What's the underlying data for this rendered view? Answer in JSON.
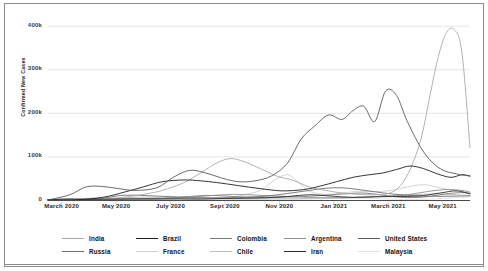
{
  "chart_data": {
    "type": "line",
    "title": "",
    "xlabel": "",
    "ylabel": "Confirmed New Cases",
    "ylim": [
      0,
      420000
    ],
    "yticks": [
      0,
      100000,
      200000,
      300000,
      400000
    ],
    "ytick_labels": [
      "0",
      "100k",
      "200k",
      "300k",
      "400k"
    ],
    "xtick_labels": [
      "March 2020",
      "May 2020",
      "July 2020",
      "Sept 2020",
      "Nov 2020",
      "Jan 2021",
      "March 2021",
      "May 2021"
    ],
    "xtick_positions": [
      0.5,
      2.5,
      4.5,
      6.5,
      8.5,
      10.5,
      12.5,
      14.5
    ],
    "x_unit": "month index from Feb 2020",
    "xlim": [
      0,
      15.5
    ],
    "grid": "horizontal",
    "legend_position": "bottom",
    "series": [
      {
        "name": "India",
        "color": "#a9a9a9",
        "x": [
          0,
          1,
          2,
          3,
          3.6,
          4.2,
          5,
          5.6,
          6.2,
          6.7,
          7.2,
          7.8,
          8.4,
          9,
          9.6,
          10.2,
          10.8,
          11.4,
          12,
          12.5,
          12.9,
          13.3,
          13.7,
          14.0,
          14.3,
          14.6,
          14.9,
          15.2,
          15.5
        ],
        "values": [
          0,
          100,
          2000,
          8000,
          14000,
          22000,
          40000,
          62000,
          85000,
          95000,
          88000,
          72000,
          55000,
          45000,
          30000,
          22000,
          16000,
          13000,
          12000,
          15000,
          30000,
          70000,
          140000,
          230000,
          320000,
          380000,
          392000,
          340000,
          120000
        ]
      },
      {
        "name": "Russia",
        "color": "#6d6d6d",
        "x": [
          0,
          1,
          2,
          2.6,
          3.2,
          4,
          5,
          6,
          7,
          8,
          8.8,
          9.6,
          10.2,
          10.8,
          11.4,
          12,
          12.6,
          13.2,
          13.8,
          14.4,
          15,
          15.5
        ],
        "values": [
          0,
          200,
          4000,
          10000,
          11000,
          9000,
          6500,
          5000,
          5500,
          9000,
          15000,
          22000,
          27000,
          28000,
          24000,
          19000,
          14000,
          11000,
          9000,
          8500,
          9000,
          9500
        ]
      },
      {
        "name": "Brazil",
        "color": "#1e1e1e",
        "x": [
          0,
          1,
          2,
          2.8,
          3.5,
          4.2,
          5,
          5.6,
          6.2,
          7,
          7.8,
          8.6,
          9.4,
          10,
          10.6,
          11.2,
          11.8,
          12.3,
          12.8,
          13.3,
          13.8,
          14.3,
          14.8,
          15.2,
          15.5
        ],
        "values": [
          0,
          300,
          6000,
          18000,
          30000,
          42000,
          46000,
          44000,
          40000,
          33000,
          26000,
          21000,
          24000,
          32000,
          42000,
          52000,
          58000,
          62000,
          70000,
          78000,
          72000,
          60000,
          52000,
          58000,
          55000
        ]
      },
      {
        "name": "France",
        "color": "#cfcfcf",
        "x": [
          0,
          1,
          1.8,
          2.5,
          3.5,
          4.5,
          5.5,
          6.5,
          7.2,
          7.8,
          8.3,
          8.8,
          9.2,
          9.6,
          10.2,
          10.8,
          11.4,
          12,
          12.6,
          13.2,
          13.8,
          14.4,
          15,
          15.5
        ],
        "values": [
          0,
          2000,
          5000,
          4000,
          1500,
          800,
          1500,
          5000,
          12000,
          22000,
          45000,
          58000,
          40000,
          20000,
          13000,
          16000,
          20000,
          19000,
          22000,
          30000,
          35000,
          28000,
          20000,
          16000
        ]
      },
      {
        "name": "Colombia",
        "color": "#7a7a7a",
        "x": [
          0,
          1.5,
          2.5,
          3.5,
          4.5,
          5.2,
          5.8,
          6.4,
          7,
          7.8,
          8.6,
          9.4,
          10.2,
          11,
          11.6,
          12.2,
          12.8,
          13.4,
          14,
          14.6,
          15.2,
          15.5
        ],
        "values": [
          0,
          200,
          1000,
          2500,
          5000,
          8000,
          10500,
          9500,
          7500,
          6000,
          6500,
          8000,
          11000,
          14500,
          16000,
          12000,
          7000,
          5500,
          8000,
          14000,
          17000,
          15000
        ]
      },
      {
        "name": "Chile",
        "color": "#bdbdbd",
        "x": [
          0,
          1.2,
          2.2,
          3,
          3.6,
          4.2,
          5,
          6,
          7,
          8,
          9,
          10,
          11,
          11.8,
          12.6,
          13.4,
          14.2,
          15,
          15.5
        ],
        "values": [
          0,
          300,
          2000,
          5500,
          6500,
          5000,
          3500,
          2500,
          2200,
          2500,
          3000,
          4000,
          5000,
          6500,
          9000,
          12000,
          14000,
          12000,
          10000
        ]
      },
      {
        "name": "Argentina",
        "color": "#8f8f8f",
        "x": [
          0,
          1.5,
          2.5,
          3.5,
          4.5,
          5.5,
          6.2,
          6.8,
          7.4,
          8,
          8.8,
          9.6,
          10.4,
          11.2,
          12,
          12.8,
          13.4,
          14,
          14.6,
          15.2,
          15.5
        ],
        "values": [
          0,
          100,
          600,
          1800,
          4000,
          8000,
          11000,
          13000,
          12000,
          10000,
          8000,
          6000,
          5000,
          6000,
          7500,
          10000,
          14000,
          20000,
          24000,
          22000,
          18000
        ]
      },
      {
        "name": "Iran",
        "color": "#2b2b2b",
        "x": [
          0,
          0.8,
          1.6,
          2.4,
          3.2,
          4,
          4.8,
          5.6,
          6.4,
          7.2,
          8,
          8.8,
          9.6,
          10.4,
          11.2,
          12,
          12.8,
          13.6,
          14.4,
          15,
          15.5
        ],
        "values": [
          800,
          2500,
          1500,
          2200,
          2800,
          2400,
          2700,
          2200,
          3500,
          4000,
          5000,
          8000,
          12000,
          9000,
          6000,
          7500,
          8000,
          9000,
          16000,
          21000,
          14000
        ]
      },
      {
        "name": "United States",
        "color": "#5a5a5a",
        "x": [
          0,
          0.8,
          1.4,
          2,
          2.6,
          3.2,
          4,
          4.6,
          5.2,
          5.8,
          6.4,
          7,
          7.6,
          8.2,
          8.8,
          9.3,
          9.8,
          10.3,
          10.8,
          11.2,
          11.6,
          12,
          12.4,
          12.8,
          13.2,
          13.8,
          14.4,
          15,
          15.5
        ],
        "values": [
          0,
          12000,
          30000,
          31000,
          26000,
          22000,
          28000,
          52000,
          68000,
          62000,
          50000,
          42000,
          44000,
          55000,
          85000,
          140000,
          170000,
          195000,
          185000,
          205000,
          215000,
          180000,
          250000,
          240000,
          180000,
          110000,
          72000,
          60000,
          55000
        ]
      },
      {
        "name": "Malaysia",
        "color": "#e0e0e0",
        "x": [
          0,
          2,
          4,
          6,
          8,
          9,
          10,
          11,
          11.8,
          12.4,
          13,
          13.6,
          14.2,
          14.8,
          15.5
        ],
        "values": [
          0,
          200,
          100,
          150,
          300,
          900,
          2500,
          4500,
          3500,
          2500,
          1500,
          1200,
          2500,
          5000,
          7000
        ]
      }
    ]
  },
  "axis": {
    "ylabel": "Confirmed New Cases",
    "yticks": [
      "400k",
      "300k",
      "200k",
      "100k",
      "0"
    ],
    "xticks": [
      "March 2020",
      "May 2020",
      "July 2020",
      "Sept 2020",
      "Nov 2020",
      "Jan 2021",
      "March 2021",
      "May 2021"
    ]
  },
  "legend": {
    "rows": [
      [
        {
          "label": "India",
          "color": "#a9a9a9"
        },
        {
          "label": "Brazil",
          "color": "#1e1e1e"
        },
        {
          "label": "Colombia",
          "color": "#7a7a7a"
        },
        {
          "label": "Argentina",
          "color": "#8f8f8f"
        },
        {
          "label": "United States",
          "color": "#5a5a5a"
        }
      ],
      [
        {
          "label": "Russia",
          "color": "#6d6d6d"
        },
        {
          "label": "France",
          "color": "#cfcfcf"
        },
        {
          "label": "Chile",
          "color": "#bdbdbd"
        },
        {
          "label": "Iran",
          "color": "#2b2b2b"
        },
        {
          "label": "Malaysia",
          "color": "#e0e0e0"
        }
      ]
    ]
  }
}
